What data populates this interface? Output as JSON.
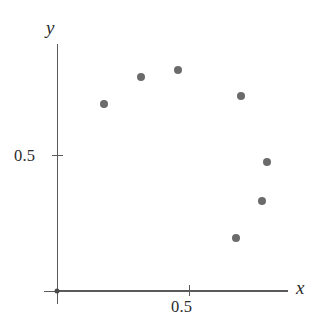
{
  "chart_data": {
    "type": "scatter",
    "title": "",
    "xlabel": "x",
    "ylabel": "y",
    "xlim": [
      0,
      0.88
    ],
    "ylim": [
      0,
      0.94
    ],
    "grid": false,
    "legend": null,
    "x_ticks": [
      {
        "value": 0.5,
        "label": "0.5"
      }
    ],
    "y_ticks": [
      {
        "value": 0.5,
        "label": "0.5"
      }
    ],
    "marker_color": "#6b6b6b",
    "axis_color": "#5a5a5a",
    "points": [
      {
        "x": 0.18,
        "y": 0.71
      },
      {
        "x": 0.32,
        "y": 0.81
      },
      {
        "x": 0.46,
        "y": 0.84
      },
      {
        "x": 0.7,
        "y": 0.74
      },
      {
        "x": 0.8,
        "y": 0.49
      },
      {
        "x": 0.78,
        "y": 0.34
      },
      {
        "x": 0.68,
        "y": 0.2
      },
      {
        "x": 0.0,
        "y": 0.0
      }
    ]
  },
  "axes": {
    "x_name": "x",
    "y_name": "y",
    "x_tick_label": "0.5",
    "y_tick_label": "0.5"
  }
}
